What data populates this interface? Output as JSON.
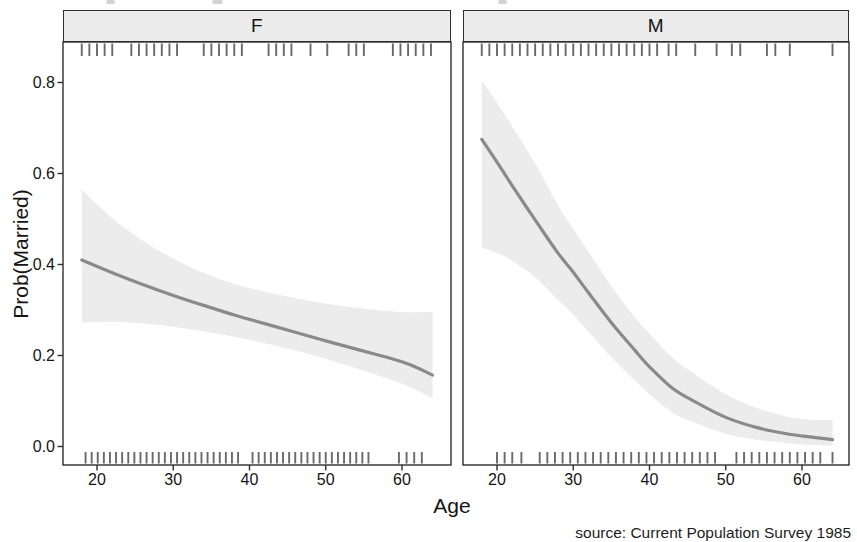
{
  "chart_data": {
    "type": "line",
    "subtype": "faceted smooth curve with confidence ribbon and rug marks",
    "title": "",
    "xlabel": "Age",
    "ylabel": "Prob(Married)",
    "caption": "source: Current Population Survey 1985",
    "grid": false,
    "legend": "none",
    "x_ticks": [
      "20",
      "30",
      "40",
      "50",
      "60"
    ],
    "x_tick_values": [
      20,
      30,
      40,
      50,
      60
    ],
    "y_ticks": [
      "0.0",
      "0.2",
      "0.4",
      "0.6",
      "0.8"
    ],
    "y_tick_values": [
      0.0,
      0.2,
      0.4,
      0.6,
      0.8
    ],
    "xlim_displayed": [
      15.5,
      66.4
    ],
    "ylim_displayed": [
      -0.04,
      0.89
    ],
    "x_data_range": [
      18,
      64
    ],
    "ylim": [
      0.0,
      0.8
    ],
    "facets": [
      {
        "label": "F",
        "smooth": {
          "x": [
            18,
            22,
            26,
            30,
            34,
            38,
            42,
            46,
            50,
            54,
            58,
            61,
            64
          ],
          "y": [
            0.41,
            0.382,
            0.356,
            0.332,
            0.31,
            0.289,
            0.27,
            0.251,
            0.232,
            0.214,
            0.196,
            0.18,
            0.157
          ]
        },
        "ribbon": {
          "x": [
            18,
            22,
            26,
            30,
            34,
            38,
            42,
            46,
            50,
            54,
            58,
            61,
            64
          ],
          "lower": [
            0.272,
            0.274,
            0.271,
            0.263,
            0.253,
            0.241,
            0.227,
            0.211,
            0.193,
            0.172,
            0.15,
            0.131,
            0.107
          ],
          "upper": [
            0.565,
            0.502,
            0.452,
            0.413,
            0.381,
            0.357,
            0.34,
            0.326,
            0.314,
            0.305,
            0.298,
            0.295,
            0.296
          ]
        },
        "rug_top": [
          18,
          19,
          20,
          21,
          22,
          24.5,
          25.5,
          26.5,
          27.5,
          28.5,
          29.5,
          30.5,
          34,
          35,
          36,
          37,
          38,
          39,
          42.5,
          43.5,
          44.5,
          45.5,
          48,
          50.2,
          53,
          54,
          55,
          58.8,
          59.8,
          60.8,
          61.8,
          62.8,
          63.8
        ],
        "rug_bottom": [
          18.5,
          19.3,
          20.1,
          20.9,
          21.7,
          22.5,
          23.3,
          24.1,
          24.9,
          25.7,
          26.5,
          27.3,
          28.1,
          28.9,
          29.7,
          30.5,
          31.3,
          32.1,
          32.9,
          33.7,
          34.5,
          35.3,
          36.1,
          36.9,
          37.7,
          38.5,
          40.4,
          41.2,
          42,
          42.8,
          43.6,
          44.4,
          45.2,
          46,
          46.8,
          47.6,
          48.4,
          49.2,
          50,
          50.8,
          51.6,
          52.4,
          53.2,
          54,
          54.8,
          55.6,
          59.6,
          60.6,
          61.6,
          62.6
        ]
      },
      {
        "label": "M",
        "smooth": {
          "x": [
            18,
            20,
            22,
            25,
            28,
            30,
            32,
            35,
            38,
            40,
            43,
            46,
            50,
            54,
            58,
            61,
            64
          ],
          "y": [
            0.675,
            0.625,
            0.573,
            0.498,
            0.425,
            0.383,
            0.338,
            0.272,
            0.213,
            0.175,
            0.128,
            0.098,
            0.064,
            0.042,
            0.028,
            0.021,
            0.015
          ]
        },
        "ribbon": {
          "x": [
            18,
            20,
            22,
            25,
            28,
            30,
            32,
            35,
            38,
            40,
            43,
            46,
            50,
            54,
            58,
            61,
            64
          ],
          "lower": [
            0.438,
            0.425,
            0.408,
            0.372,
            0.322,
            0.29,
            0.252,
            0.196,
            0.146,
            0.115,
            0.075,
            0.052,
            0.028,
            0.015,
            0.008,
            0.004,
            0.002
          ],
          "upper": [
            0.805,
            0.755,
            0.703,
            0.622,
            0.53,
            0.478,
            0.428,
            0.352,
            0.286,
            0.248,
            0.195,
            0.158,
            0.115,
            0.085,
            0.066,
            0.059,
            0.058
          ]
        },
        "rug_top": [
          18,
          19,
          20,
          21,
          22,
          23,
          24,
          25,
          26,
          27,
          28,
          29,
          30,
          31,
          32,
          33,
          34,
          35,
          36,
          37,
          38,
          39,
          40,
          41,
          42.5,
          43.5,
          46,
          48.8,
          50.8,
          51.9,
          55.4,
          56.5,
          58.4,
          64
        ],
        "rug_bottom": [
          20,
          21,
          22,
          23.2,
          25.6,
          26.6,
          27.6,
          28.6,
          29.6,
          30.6,
          31.6,
          32.6,
          33.6,
          34.6,
          35.6,
          36.6,
          37.6,
          38.6,
          39.6,
          40.6,
          41.6,
          42.6,
          43.6,
          44.6,
          45.6,
          46.6,
          47.6,
          48.6,
          51.4,
          52.4,
          53.4,
          54.4,
          55.4,
          56.4,
          57.4,
          58.4,
          59.4,
          60.4,
          61.4,
          62.4,
          64
        ]
      }
    ],
    "colors": {
      "line": "#8a8a8a",
      "ribbon": "#ececec",
      "rug": "#4f4f4f",
      "strip_bg": "#ebebeb",
      "border": "#2e2e2e",
      "text": "#141414",
      "background": "#ffffff"
    }
  }
}
